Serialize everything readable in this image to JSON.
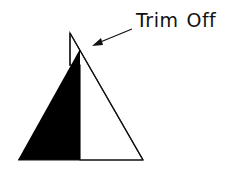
{
  "diagram": {
    "label": {
      "word1": "Trim",
      "word2": "Off"
    },
    "colors": {
      "sail_dark": "#000000",
      "sail_light": "#ffffff",
      "outline": "#111111"
    }
  }
}
